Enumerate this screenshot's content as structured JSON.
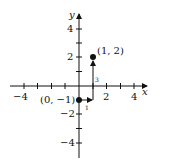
{
  "diagram": {
    "type": "coordinate-plane",
    "axes": {
      "x_label": "x",
      "y_label": "y",
      "x_range": [
        -4.5,
        4.5
      ],
      "y_range": [
        -5,
        5
      ],
      "x_tick_labels": [
        "−4",
        "2",
        "4"
      ],
      "y_tick_labels": [
        "4",
        "2",
        "−2",
        "−4"
      ]
    },
    "points": [
      {
        "label": "(0, −1)",
        "x": 0,
        "y": -1
      },
      {
        "label": "(1, 2)",
        "x": 1,
        "y": 2
      }
    ],
    "steps": {
      "run_label": "1",
      "rise_label": "3"
    },
    "colors": {
      "ink": "#111111",
      "background": "#ffffff"
    }
  }
}
